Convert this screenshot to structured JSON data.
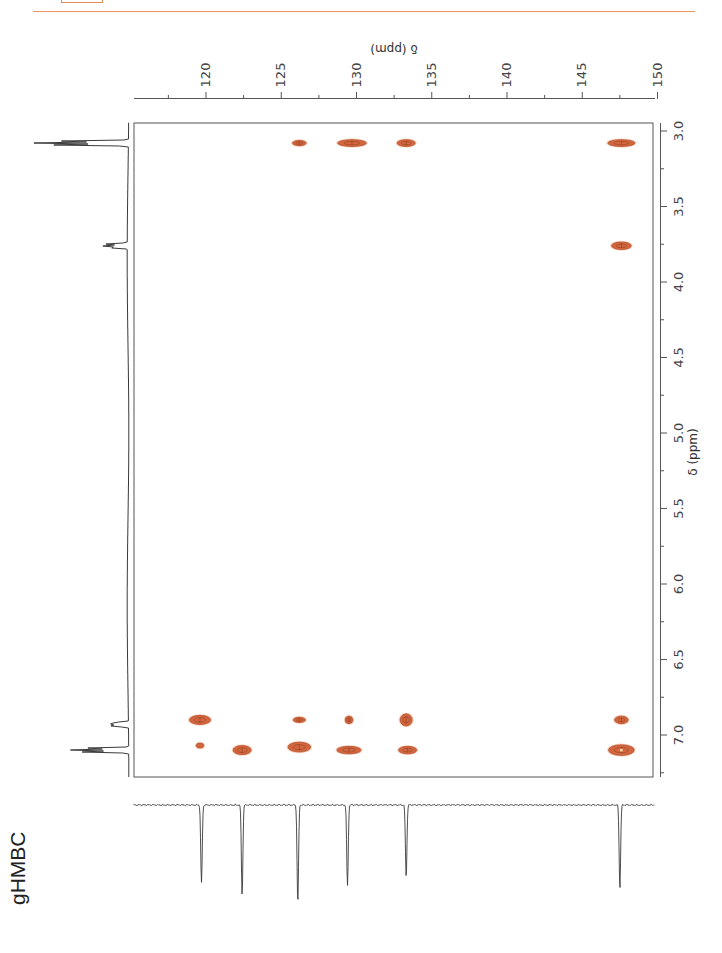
{
  "header": {
    "rule_color": "#e9915f",
    "tab_box_color": "#e88a5c"
  },
  "side_label": "gHMBC",
  "colors": {
    "cross_peak_fill": "#d2673f",
    "cross_peak_edge": "#b8502e",
    "cross_peak_center": "#f4d0a0",
    "spectrum_line": "#3a3a3a",
    "axis_line": "#555555"
  },
  "chart_data": {
    "type": "heatmap",
    "subtype": "2D NMR gHMBC contour plot",
    "title": "gHMBC",
    "xlabel": "δ (ppm)",
    "xlabel_orientation": "upside-down, top",
    "ylabel": "δ (ppm)",
    "ylabel_orientation": "rotated, right",
    "x_axis": {
      "nucleus": "13C",
      "position": "top",
      "ticks": [
        120,
        125,
        130,
        135,
        140,
        145,
        150
      ],
      "minor_ticks": [
        117.5,
        122.5,
        127.5,
        132.5,
        137.5,
        142.5,
        147.5
      ],
      "range": [
        117.5,
        150
      ]
    },
    "y_axis": {
      "nucleus": "1H",
      "position": "right",
      "ticks": [
        "3.0",
        "3.5",
        "4.0",
        "4.5",
        "5.0",
        "5.5",
        "6.0",
        "6.5",
        "7.0"
      ],
      "minor_ticks": [
        3.25,
        3.75,
        4.25,
        4.75,
        5.25,
        5.75,
        6.25,
        6.75,
        7.25
      ],
      "range": [
        2.95,
        7.25
      ]
    },
    "grid": false,
    "proton_projection": {
      "position": "left",
      "peaks": [
        {
          "ppm": 3.08,
          "intensity": 1.0,
          "multiplet": true
        },
        {
          "ppm": 3.76,
          "intensity": 0.28,
          "multiplet": true
        },
        {
          "ppm": 6.93,
          "intensity": 0.25,
          "multiplet": true
        },
        {
          "ppm": 7.1,
          "intensity": 0.62,
          "multiplet": true
        }
      ]
    },
    "carbon_projection": {
      "position": "bottom",
      "inverted": true,
      "peaks": [
        {
          "ppm": 119.7,
          "intensity": 0.78
        },
        {
          "ppm": 122.4,
          "intensity": 0.9
        },
        {
          "ppm": 126.1,
          "intensity": 0.98
        },
        {
          "ppm": 129.4,
          "intensity": 0.81
        },
        {
          "ppm": 133.3,
          "intensity": 0.72
        },
        {
          "ppm": 147.5,
          "intensity": 0.83
        }
      ]
    },
    "cross_peaks": [
      {
        "c_ppm": 126.2,
        "h_ppm": 3.08,
        "w": 0.9,
        "h": 0.035,
        "size": "small"
      },
      {
        "c_ppm": 129.7,
        "h_ppm": 3.08,
        "w": 1.9,
        "h": 0.045,
        "size": "large"
      },
      {
        "c_ppm": 133.3,
        "h_ppm": 3.08,
        "w": 1.2,
        "h": 0.045,
        "size": "medium"
      },
      {
        "c_ppm": 147.6,
        "h_ppm": 3.08,
        "w": 1.8,
        "h": 0.045,
        "size": "large"
      },
      {
        "c_ppm": 147.6,
        "h_ppm": 3.76,
        "w": 1.3,
        "h": 0.05,
        "size": "medium"
      },
      {
        "c_ppm": 119.6,
        "h_ppm": 6.9,
        "w": 1.4,
        "h": 0.06,
        "size": "medium"
      },
      {
        "c_ppm": 126.2,
        "h_ppm": 6.9,
        "w": 0.8,
        "h": 0.035,
        "size": "small"
      },
      {
        "c_ppm": 129.5,
        "h_ppm": 6.9,
        "w": 0.5,
        "h": 0.05,
        "size": "small"
      },
      {
        "c_ppm": 133.3,
        "h_ppm": 6.9,
        "w": 0.8,
        "h": 0.08,
        "size": "small"
      },
      {
        "c_ppm": 147.6,
        "h_ppm": 6.9,
        "w": 0.9,
        "h": 0.05,
        "size": "small"
      },
      {
        "c_ppm": 119.6,
        "h_ppm": 7.07,
        "w": 0.5,
        "h": 0.02,
        "size": "tiny"
      },
      {
        "c_ppm": 122.4,
        "h_ppm": 7.1,
        "w": 1.2,
        "h": 0.06,
        "size": "medium"
      },
      {
        "c_ppm": 126.2,
        "h_ppm": 7.08,
        "w": 1.5,
        "h": 0.065,
        "size": "medium"
      },
      {
        "c_ppm": 129.5,
        "h_ppm": 7.1,
        "w": 1.6,
        "h": 0.05,
        "size": "medium"
      },
      {
        "c_ppm": 133.4,
        "h_ppm": 7.1,
        "w": 1.2,
        "h": 0.05,
        "size": "medium"
      },
      {
        "c_ppm": 147.6,
        "h_ppm": 7.1,
        "w": 1.7,
        "h": 0.07,
        "size": "large"
      }
    ]
  }
}
